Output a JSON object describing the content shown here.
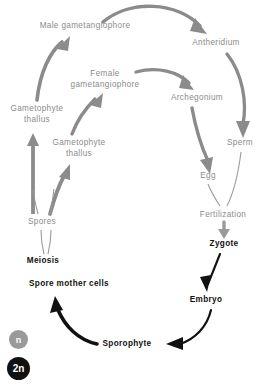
{
  "diagram": {
    "colors": {
      "haploid_gray": "#8b8b8b",
      "diploid_black": "#111111",
      "background": "#ffffff"
    },
    "nodes": [
      {
        "id": "male-gametangiophore",
        "label": "Male gametangiophore",
        "phase": "n",
        "x": 85,
        "y": 26,
        "lines": 1
      },
      {
        "id": "antheridium",
        "label": "Antheridium",
        "phase": "n",
        "x": 216,
        "y": 43,
        "lines": 1
      },
      {
        "id": "female-gametangiophore",
        "label": "Female gametangiophore",
        "phase": "n",
        "x": 105,
        "y": 79,
        "lines": 2,
        "label_line_1": "Female",
        "label_line_2": "gametangiophore"
      },
      {
        "id": "archegonium",
        "label": "Archegonium",
        "phase": "n",
        "x": 197,
        "y": 98,
        "lines": 1
      },
      {
        "id": "gametophyte-thallus-1",
        "label": "Gametophyte thallus",
        "phase": "n",
        "x": 37,
        "y": 114,
        "lines": 2,
        "label_line_1": "Gametophyte",
        "label_line_2": "thallus"
      },
      {
        "id": "sperm",
        "label": "Sperm",
        "phase": "n",
        "x": 240,
        "y": 143,
        "lines": 1
      },
      {
        "id": "gametophyte-thallus-2",
        "label": "Gametophyte thallus",
        "phase": "n",
        "x": 79,
        "y": 148,
        "lines": 2,
        "label_line_1": "Gametophyte",
        "label_line_2": "thallus"
      },
      {
        "id": "egg",
        "label": "Egg",
        "phase": "n",
        "x": 208,
        "y": 176,
        "lines": 1
      },
      {
        "id": "fertilization",
        "label": "Fertilization",
        "phase": "n",
        "x": 223,
        "y": 215,
        "lines": 1
      },
      {
        "id": "spores",
        "label": "Spores",
        "phase": "n",
        "x": 42,
        "y": 222,
        "lines": 1
      },
      {
        "id": "zygote",
        "label": "Zygote",
        "phase": "2n",
        "x": 224,
        "y": 244,
        "lines": 1
      },
      {
        "id": "meiosis",
        "label": "Meiosis",
        "phase": "2n",
        "x": 43,
        "y": 261,
        "lines": 1
      },
      {
        "id": "spore-mother-cells",
        "label": "Spore mother cells",
        "phase": "2n",
        "x": 69,
        "y": 284,
        "lines": 1
      },
      {
        "id": "embryo",
        "label": "Embryo",
        "phase": "2n",
        "x": 206,
        "y": 300,
        "lines": 1
      },
      {
        "id": "sporophyte",
        "label": "Sporophyte",
        "phase": "2n",
        "x": 127,
        "y": 344,
        "lines": 1
      }
    ],
    "edges": [
      {
        "id": "male-gametangiophore-to-antheridium",
        "from": "male-gametangiophore",
        "to": "antheridium",
        "style": "thick-arrow",
        "color": "#8b8b8b"
      },
      {
        "id": "thallus1-to-male",
        "from": "gametophyte-thallus-1",
        "to": "male-gametangiophore",
        "style": "thick-arrow",
        "color": "#8b8b8b"
      },
      {
        "id": "thallus2-to-female",
        "from": "gametophyte-thallus-2",
        "to": "female-gametangiophore",
        "style": "thick-arrow",
        "color": "#8b8b8b"
      },
      {
        "id": "female-to-archegonium",
        "from": "female-gametangiophore",
        "to": "archegonium",
        "style": "thick-arrow",
        "color": "#8b8b8b"
      },
      {
        "id": "antheridium-to-sperm",
        "from": "antheridium",
        "to": "sperm",
        "style": "thick-arrow",
        "color": "#8b8b8b"
      },
      {
        "id": "archegonium-to-egg",
        "from": "archegonium",
        "to": "egg",
        "style": "thick-arrow",
        "color": "#8b8b8b"
      },
      {
        "id": "sperm-to-fertilization",
        "from": "sperm",
        "to": "fertilization",
        "style": "thin-line",
        "color": "#9a9a9a"
      },
      {
        "id": "egg-to-fertilization",
        "from": "egg",
        "to": "fertilization",
        "style": "thin-line",
        "color": "#9a9a9a"
      },
      {
        "id": "fertilization-to-zygote",
        "from": "fertilization",
        "to": "zygote",
        "style": "thick-arrow",
        "color": "#9a9a9a"
      },
      {
        "id": "zygote-to-embryo",
        "from": "zygote",
        "to": "embryo",
        "style": "thin-arrow",
        "color": "#111111"
      },
      {
        "id": "embryo-to-sporophyte",
        "from": "embryo",
        "to": "sporophyte",
        "style": "thick-arrow",
        "color": "#111111"
      },
      {
        "id": "sporophyte-to-spore-mother-cells",
        "from": "sporophyte",
        "to": "spore-mother-cells",
        "style": "thick-arrow",
        "color": "#111111"
      },
      {
        "id": "spore-mother-cells-to-meiosis",
        "from": "spore-mother-cells",
        "to": "meiosis",
        "style": "implicit",
        "color": "#111111"
      },
      {
        "id": "meiosis-to-spores",
        "from": "meiosis",
        "to": "spores",
        "style": "thin-line",
        "color": "#9a9a9a"
      },
      {
        "id": "spores-to-thallus-1",
        "from": "spores",
        "to": "gametophyte-thallus-1",
        "style": "thick-arrow",
        "color": "#8b8b8b"
      },
      {
        "id": "spores-to-thallus-2",
        "from": "spores",
        "to": "gametophyte-thallus-2",
        "style": "thick-arrow",
        "color": "#8b8b8b"
      }
    ],
    "legend": {
      "haploid": {
        "symbol": "n",
        "color": "#9a9a9a"
      },
      "diploid": {
        "symbol": "2n",
        "color": "#111111"
      }
    }
  }
}
